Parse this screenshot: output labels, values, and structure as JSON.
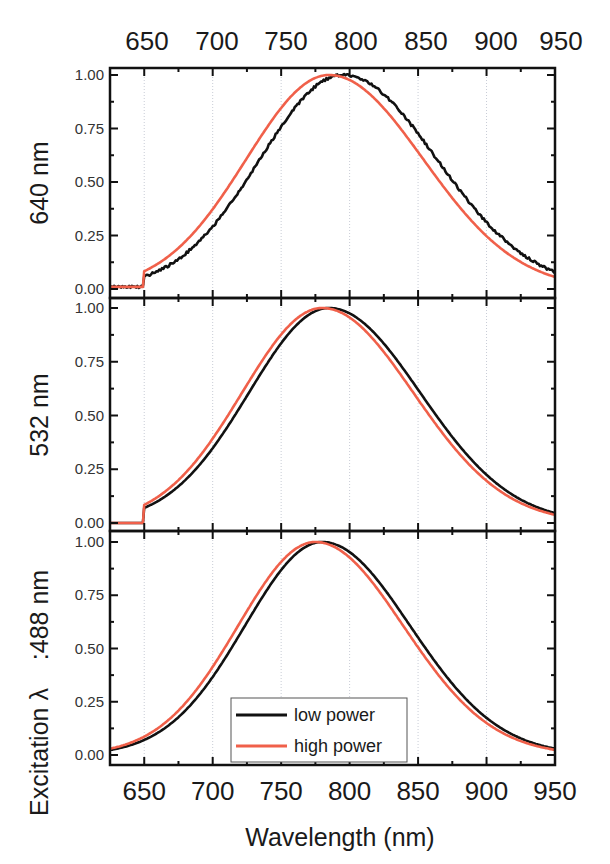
{
  "chart_data": {
    "type": "line",
    "layout": "3 stacked panels sharing x-axis, duplicated top x tick labels",
    "xlabel": "Wavelength (nm)",
    "ylabel_shared": "Excitation λ",
    "xlim": [
      625,
      950
    ],
    "x_ticks": [
      650,
      700,
      750,
      800,
      850,
      900,
      950
    ],
    "x_tick_labels_top": [
      "650",
      "700",
      "750",
      "800",
      "850",
      "900",
      "950"
    ],
    "x_tick_labels_bottom": [
      "650",
      "700",
      "750",
      "800",
      "850",
      "900",
      "950"
    ],
    "ylim": [
      0,
      1
    ],
    "y_ticks": [
      "0.00",
      "0.25",
      "0.50",
      "0.75",
      "1.00"
    ],
    "grid": "vertical dotted gridlines at major x ticks",
    "legend": {
      "position": "bottom panel, lower center",
      "entries": [
        {
          "label": "low power",
          "color": "#111111"
        },
        {
          "label": "high power",
          "color": "#f0604a"
        }
      ]
    },
    "panels": [
      {
        "label": "640 nm",
        "series": [
          {
            "name": "low power",
            "peak_nm": 795,
            "fwhm_nm": 150,
            "baseline_below_650": 0.01,
            "step_at_650": 0.04
          },
          {
            "name": "high power",
            "peak_nm": 785,
            "fwhm_nm": 150,
            "baseline_below_650": 0.01,
            "step_at_650": 0.05
          }
        ]
      },
      {
        "label": "532 nm",
        "series": [
          {
            "name": "low power",
            "peak_nm": 785,
            "fwhm_nm": 145,
            "baseline_below_650": 0.0,
            "step_at_650": 0.07
          },
          {
            "name": "high power",
            "peak_nm": 780,
            "fwhm_nm": 145,
            "baseline_below_650": 0.0,
            "step_at_650": 0.08
          }
        ]
      },
      {
        "label": ":488 nm",
        "series": [
          {
            "name": "low power",
            "peak_nm": 780,
            "fwhm_nm": 140
          },
          {
            "name": "high power",
            "peak_nm": 775,
            "fwhm_nm": 140
          }
        ]
      }
    ]
  },
  "labels": {
    "panel_top": "640 nm",
    "panel_mid": "532 nm",
    "panel_bottom": ":488 nm",
    "shared_prefix": "Excitation λ",
    "xlabel": "Wavelength (nm)",
    "legend_low": "low power",
    "legend_high": "high power"
  },
  "colors": {
    "low_power": "#111111",
    "high_power": "#f0604a",
    "grid": "#c8ccd6"
  }
}
